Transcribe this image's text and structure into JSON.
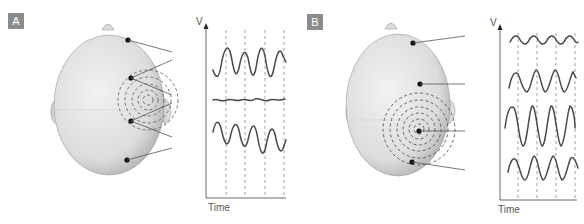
{
  "panels": [
    {
      "label": "A",
      "y_axis_label": "V",
      "x_axis_label": "Time",
      "description": "Dipole source oriented tangentially (between two electrodes); electrodes on either side of source show opposite-polarity waveforms, electrode near center shows flat trace",
      "electrodes": 4,
      "traces": [
        {
          "name": "electrode-1",
          "amplitude": "large",
          "phase": "positive"
        },
        {
          "name": "electrode-2",
          "amplitude": "near-zero",
          "phase": "flat"
        },
        {
          "name": "electrode-3",
          "amplitude": "large",
          "phase": "inverted"
        }
      ]
    },
    {
      "label": "B",
      "y_axis_label": "V",
      "x_axis_label": "Time",
      "description": "Dipole source oriented radially under one electrode; all electrodes show in-phase waveforms with amplitude largest nearest the source",
      "electrodes": 4,
      "traces": [
        {
          "name": "electrode-1",
          "amplitude": "small",
          "phase": "positive"
        },
        {
          "name": "electrode-2",
          "amplitude": "medium",
          "phase": "positive"
        },
        {
          "name": "electrode-3",
          "amplitude": "large",
          "phase": "positive"
        },
        {
          "name": "electrode-4",
          "amplitude": "medium",
          "phase": "positive"
        }
      ]
    }
  ],
  "colors": {
    "badge": "#8c8c8c",
    "trace": "#4a4a4a",
    "head_fill": "#e4e4e4",
    "head_stroke": "#9a9a9a",
    "dashed": "#888888",
    "electrode": "#111111"
  }
}
